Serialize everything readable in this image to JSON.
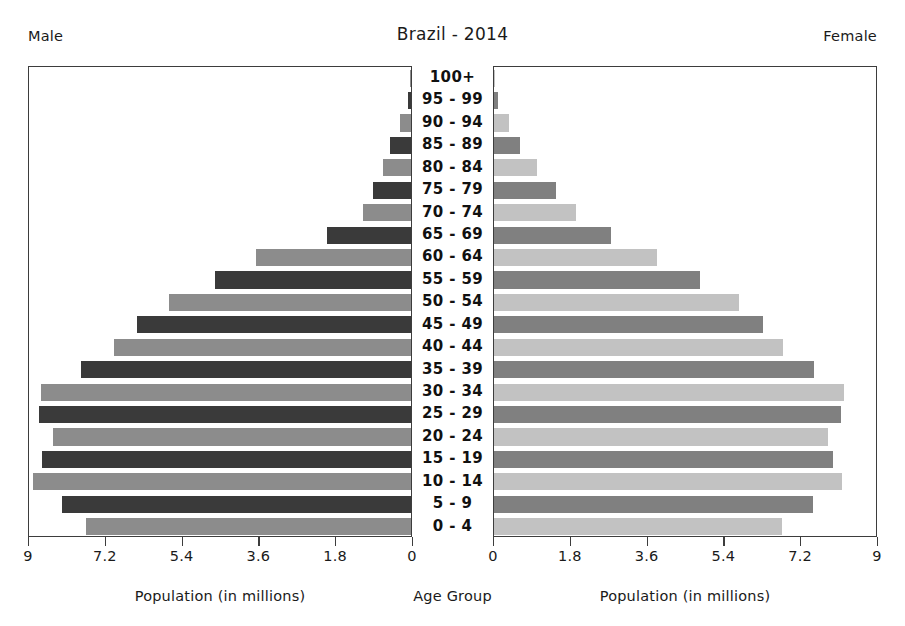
{
  "header": {
    "left_label": "Male",
    "right_label": "Female",
    "title": "Brazil - 2014"
  },
  "footer": {
    "left_axis_title": "Population (in millions)",
    "center_axis_title": "Age Group",
    "right_axis_title": "Population (in millions)"
  },
  "axis": {
    "left_ticks": [
      "9",
      "7.2",
      "5.4",
      "3.6",
      "1.8",
      "0"
    ],
    "right_ticks": [
      "0",
      "1.8",
      "3.6",
      "5.4",
      "7.2",
      "9"
    ]
  },
  "chart_data": {
    "type": "bar",
    "subtype": "population-pyramid",
    "title": "Brazil - 2014",
    "xlabel": "Population (in millions)",
    "ylabel": "Age Group",
    "xlim": [
      0,
      9
    ],
    "grid": false,
    "legend": false,
    "categories": [
      "100+",
      "95 - 99",
      "90 - 94",
      "85 - 89",
      "80 - 84",
      "75 - 79",
      "70 - 74",
      "65 - 69",
      "60 - 64",
      "55 - 59",
      "50 - 54",
      "45 - 49",
      "40 - 44",
      "35 - 39",
      "30 - 34",
      "25 - 29",
      "20 - 24",
      "15 - 19",
      "10 - 14",
      "5 - 9",
      "0 - 4"
    ],
    "series": [
      {
        "name": "Male",
        "side": "left",
        "color_dark": "#3a3a3a",
        "color_light": "#8c8c8c",
        "values": [
          0.02,
          0.07,
          0.26,
          0.49,
          0.66,
          0.9,
          1.13,
          1.96,
          3.63,
          4.59,
          5.68,
          6.43,
          6.95,
          7.73,
          8.67,
          8.72,
          8.39,
          8.65,
          8.86,
          8.18,
          7.61
        ]
      },
      {
        "name": "Female",
        "side": "right",
        "color_dark": "#808080",
        "color_light": "#c2c2c2",
        "values": [
          0.03,
          0.1,
          0.35,
          0.61,
          1.01,
          1.45,
          1.93,
          2.75,
          3.81,
          4.82,
          5.74,
          6.3,
          6.77,
          7.51,
          8.2,
          8.14,
          7.83,
          7.95,
          8.16,
          7.48,
          6.75
        ]
      }
    ]
  }
}
